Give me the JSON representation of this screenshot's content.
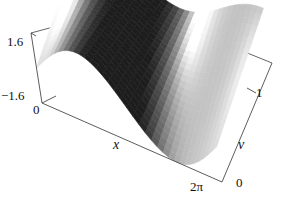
{
  "figure": {
    "kind": "surface-plot-3d",
    "background_color": "#ffffff",
    "frame_color": "#3a3a3a",
    "shading": "grayscale"
  },
  "axes": {
    "x": {
      "label": "x",
      "min_tick": "0",
      "max_tick": "2π",
      "range": [
        0,
        6.283185307179586
      ]
    },
    "v": {
      "label": "v",
      "min_tick": "0",
      "max_tick": "1",
      "range": [
        0,
        1
      ]
    },
    "z": {
      "label": "",
      "min_tick": "−1.6",
      "max_tick": "1.6",
      "range": [
        -1.6,
        1.6
      ]
    }
  },
  "chart_data": {
    "type": "surface",
    "title": "",
    "xlabel": "x",
    "ylabel": "v",
    "zlabel": "",
    "xlim": [
      0,
      6.283185307179586
    ],
    "ylim": [
      0,
      1
    ],
    "zlim": [
      -1.6,
      1.6
    ],
    "xticks": [
      "0",
      "2π"
    ],
    "yticks": [
      "0",
      "1"
    ],
    "zticks": [
      "−1.6",
      "1.6"
    ],
    "grid": false,
    "legend": false,
    "colormap": "grayscale",
    "surface_expression": "sin(x) * (1 - v) * 1.6 + cos(x) * v * 0.9",
    "nx": 34,
    "nv": 24,
    "view": {
      "azimuth_deg": 38,
      "elevation_deg": 22,
      "projection": "parallel"
    },
    "z_matrix_note": "z sampled on a regular grid from surface_expression over xlim x ylim",
    "features": [
      {
        "name": "ridge-crest",
        "x": 1.6,
        "v": 1.0,
        "z": 1.55
      },
      {
        "name": "front-trough",
        "x": 4.7,
        "v": 0.0,
        "z": -1.6
      },
      {
        "name": "dark-crease",
        "x": 3.2,
        "v": 0.55,
        "z": 0.1
      },
      {
        "name": "bright-fold",
        "x": 5.9,
        "v": 0.8,
        "z": 1.1
      }
    ]
  }
}
